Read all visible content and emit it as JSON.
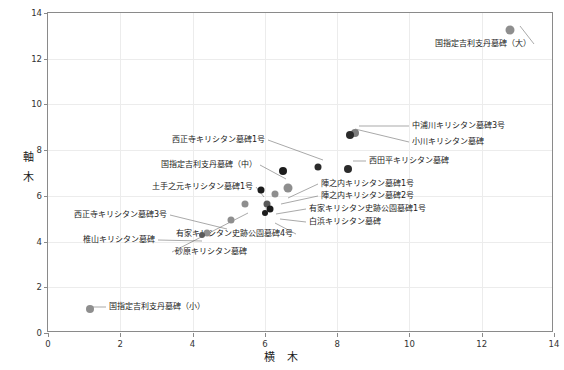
{
  "chart_data": {
    "type": "scatter",
    "title": "",
    "xlabel": "横  木",
    "ylabel": "軸\n木",
    "xlim": [
      0,
      14
    ],
    "ylim": [
      0,
      14
    ],
    "xticks": [
      0,
      2,
      4,
      6,
      8,
      10,
      12,
      14
    ],
    "yticks": [
      0,
      2,
      4,
      6,
      8,
      10,
      12,
      14
    ],
    "grid": true,
    "legend": "none",
    "points": [
      {
        "label": "国指定吉利支丹墓碑（大）",
        "x": 12.82,
        "y": 13.22,
        "size": 9,
        "color": "#8e8e8e"
      },
      {
        "label": "中浦川キリシタン墓碑3号",
        "x": 8.52,
        "y": 8.72,
        "size": 8,
        "color": "#7d7d7d"
      },
      {
        "label": "小川キリシタン墓碑",
        "x": 8.38,
        "y": 8.62,
        "size": 8,
        "color": "#2b2b2b"
      },
      {
        "label": "西田平キリシタン墓碑",
        "x": 8.33,
        "y": 7.12,
        "size": 8,
        "color": "#2b2b2b"
      },
      {
        "label": "西正寺キリシタン墓碑1号",
        "x": 7.5,
        "y": 7.2,
        "size": 7,
        "color": "#2b2b2b"
      },
      {
        "label": "国指定吉利支丹墓碑（中）",
        "x": 6.52,
        "y": 7.05,
        "size": 8,
        "color": "#1c1c1c"
      },
      {
        "label": "陣之内キリシタン墓碑1号",
        "x": 6.66,
        "y": 6.3,
        "size": 9,
        "color": "#8e8e8e"
      },
      {
        "label": "陣之内キリシタン墓碑2号",
        "x": 6.3,
        "y": 6.05,
        "size": 7,
        "color": "#8e8e8e"
      },
      {
        "label": "有家キリシタン史跡公園墓碑1号",
        "x": 6.08,
        "y": 5.62,
        "size": 7,
        "color": "#5a5a5a"
      },
      {
        "label": "白浜キリシタン墓碑",
        "x": 6.18,
        "y": 5.4,
        "size": 7,
        "color": "#1c1c1c"
      },
      {
        "label": "有家キリシタン史跡公園墓碑4号",
        "x": 6.02,
        "y": 5.22,
        "size": 6,
        "color": "#1c1c1c"
      },
      {
        "label": "土手之元キリシタン墓碑1号",
        "x": 5.92,
        "y": 6.22,
        "size": 7,
        "color": "#1c1c1c"
      },
      {
        "label": "砂原キリシタン墓碑",
        "x": 5.48,
        "y": 5.58,
        "size": 7,
        "color": "#8e8e8e"
      },
      {
        "label": "西正寺キリシタン墓碑3号",
        "x": 5.1,
        "y": 4.92,
        "size": 7,
        "color": "#8e8e8e"
      },
      {
        "label": "椎山キリシタン墓碑",
        "x": 4.42,
        "y": 4.32,
        "size": 7,
        "color": "#8e8e8e"
      },
      {
        "label": "",
        "x": 4.28,
        "y": 4.25,
        "size": 6,
        "color": "#5a5a5a"
      },
      {
        "label": "国指定吉利支丹墓碑（小）",
        "x": 1.2,
        "y": 1.02,
        "size": 8,
        "color": "#8e8e8e"
      }
    ],
    "callouts": [
      {
        "text": "国指定吉利支丹墓碑（大）",
        "side": "r",
        "tx": 534,
        "ty": 44,
        "lx": 520,
        "ly": 26
      },
      {
        "text": "中浦川キリシタン墓碑3号",
        "side": "l",
        "tx": 409,
        "ty": 126,
        "lx": 359,
        "ly": 126
      },
      {
        "text": "小川キリシタン墓碑",
        "side": "l",
        "tx": 409,
        "ty": 142,
        "lx": 355,
        "ly": 129
      },
      {
        "text": "西田平キリシタン墓碑",
        "side": "l",
        "tx": 366,
        "ty": 161,
        "lx": 353,
        "ly": 161
      },
      {
        "text": "西正寺キリシタン墓碑1号",
        "side": "r",
        "tx": 268,
        "ty": 140,
        "lx": 323,
        "ly": 160
      },
      {
        "text": "国指定吉利支丹墓碑（中）",
        "side": "r",
        "tx": 260,
        "ty": 165,
        "lx": 286,
        "ly": 179
      },
      {
        "text": "土手之元キリシタン墓碑1号",
        "side": "r",
        "tx": 256,
        "ty": 187,
        "lx": 264,
        "ly": 197
      },
      {
        "text": "陣之内キリシタン墓碑1号",
        "side": "l",
        "tx": 318,
        "ty": 184,
        "lx": 288,
        "ly": 198
      },
      {
        "text": "陣之内キリシタン墓碑2号",
        "side": "l",
        "tx": 318,
        "ty": 196,
        "lx": 281,
        "ly": 204
      },
      {
        "text": "有家キリシタン史跡公園墓碑1号",
        "side": "l",
        "tx": 306,
        "ty": 209,
        "lx": 276,
        "ly": 214
      },
      {
        "text": "白浜キリシタン墓碑",
        "side": "l",
        "tx": 306,
        "ty": 222,
        "lx": 280,
        "ly": 219
      },
      {
        "text": "有家キリシタン史跡公園墓碑4号",
        "side": "r",
        "tx": 296,
        "ty": 234,
        "lx": 275,
        "ly": 223
      },
      {
        "text": "砂原キリシタン墓碑",
        "side": "l",
        "tx": 172,
        "ty": 252,
        "lx": 248,
        "ly": 213
      },
      {
        "text": "西正寺キリシタン墓碑3号",
        "side": "r",
        "tx": 170,
        "ty": 215,
        "lx": 227,
        "ly": 229
      },
      {
        "text": "椎山キリシタン墓碑",
        "side": "r",
        "tx": 158,
        "ty": 240,
        "lx": 202,
        "ly": 241
      },
      {
        "text": "国指定吉利支丹墓碑（小）",
        "side": "l",
        "tx": 106,
        "ty": 307,
        "lx": 92,
        "ly": 307
      }
    ]
  }
}
